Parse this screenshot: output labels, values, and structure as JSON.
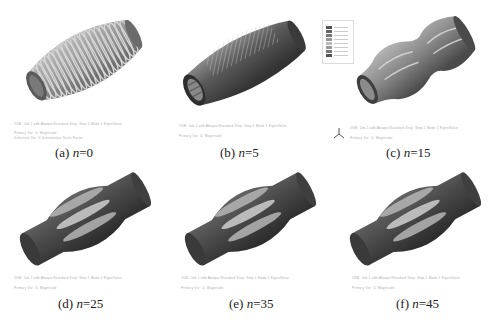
{
  "figure": {
    "panels": [
      {
        "id": "a",
        "label": "(a) ",
        "var": "n",
        "value": "=0",
        "meta_line1": "ODB: Job-1.odb  Abaqus/Standard  Step: Step-1  Mode 1  EigenValue",
        "meta_line2": "Primary Var: U, Magnitude",
        "meta_line3": "Deformed Var: U  Deformation Scale Factor"
      },
      {
        "id": "b",
        "label": "(b) ",
        "var": "n",
        "value": "=5",
        "meta_line1": "ODB: Job-1.odb  Abaqus/Standard  Step: Step-1  Mode 1  EigenValue",
        "meta_line2": "Primary Var: U, Magnitude",
        "meta_line3": ""
      },
      {
        "id": "c",
        "label": "(c) ",
        "var": "n",
        "value": "=15",
        "meta_line1": "ODB: Job-1.odb  Abaqus/Standard  Step: Step-1  Mode 1  EigenValue",
        "meta_line2": "Primary Var: U, Magnitude",
        "meta_line3": ""
      },
      {
        "id": "d",
        "label": "(d) ",
        "var": "n",
        "value": "=25",
        "meta_line1": "ODB: Job-1.odb  Abaqus/Standard  Step: Step-1  Mode 1  EigenValue",
        "meta_line2": "Primary Var: U, Magnitude",
        "meta_line3": ""
      },
      {
        "id": "e",
        "label": "(e) ",
        "var": "n",
        "value": "=35",
        "meta_line1": "ODB: Job-1.odb  Abaqus/Standard  Step: Step-1  Mode 1  EigenValue",
        "meta_line2": "Primary Var: U, Magnitude",
        "meta_line3": ""
      },
      {
        "id": "f",
        "label": "(f) ",
        "var": "n",
        "value": "=45",
        "meta_line1": "ODB: Job-1.odb  Abaqus/Standard  Step: Step-1  Mode 1  EigenValue",
        "meta_line2": "Primary Var: U, Magnitude",
        "meta_line3": ""
      }
    ],
    "colors": {
      "dark": "#3a3a3a",
      "mid": "#8a8a8a",
      "light": "#cfcfcf",
      "ring": "#b5b5b5"
    },
    "icons": {
      "triad": "axis-triad-icon",
      "legend": "contour-legend"
    }
  }
}
